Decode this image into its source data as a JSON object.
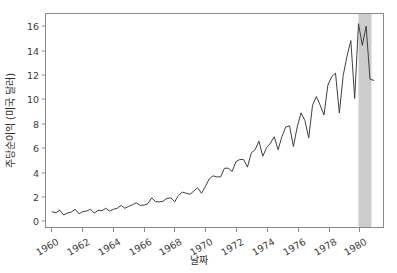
{
  "chart_data": {
    "type": "line",
    "title": "",
    "xlabel": "날짜",
    "ylabel": "주당순이익 (미국 달러)",
    "xlim": [
      1959.6,
      1981.6
    ],
    "ylim": [
      -0.55,
      17.1
    ],
    "grid": false,
    "legend": null,
    "line_color": "#404040",
    "line_width": 1.0,
    "span_color": "#cccccc",
    "axis_color": "#8a8a8a",
    "tick_label_color": "#3b3b3b",
    "xticks": [
      1960,
      1962,
      1964,
      1966,
      1968,
      1970,
      1972,
      1974,
      1976,
      1978,
      1980
    ],
    "xtick_labels": [
      "1960",
      "1962",
      "1964",
      "1966",
      "1968",
      "1970",
      "1972",
      "1974",
      "1976",
      "1978",
      "1980"
    ],
    "xtick_rotation": 30,
    "yticks": [
      0,
      2,
      4,
      6,
      8,
      10,
      12,
      14,
      16
    ],
    "ytick_labels": [
      "0",
      "2",
      "4",
      "6",
      "8",
      "10",
      "12",
      "14",
      "16"
    ],
    "shaded_spans": [
      {
        "name": "recession-band",
        "x0": 1980.0,
        "x1": 1980.85,
        "color": "#cccccc"
      }
    ],
    "series": [
      {
        "name": "주당순이익",
        "x": [
          1960.0,
          1960.25,
          1960.5,
          1960.75,
          1961.0,
          1961.25,
          1961.5,
          1961.75,
          1962.0,
          1962.25,
          1962.5,
          1962.75,
          1963.0,
          1963.25,
          1963.5,
          1963.75,
          1964.0,
          1964.25,
          1964.5,
          1964.75,
          1965.0,
          1965.25,
          1965.5,
          1965.75,
          1966.0,
          1966.25,
          1966.5,
          1966.75,
          1967.0,
          1967.25,
          1967.5,
          1967.75,
          1968.0,
          1968.25,
          1968.5,
          1968.75,
          1969.0,
          1969.25,
          1969.5,
          1969.75,
          1970.0,
          1970.25,
          1970.5,
          1970.75,
          1971.0,
          1971.25,
          1971.5,
          1971.75,
          1972.0,
          1972.25,
          1972.5,
          1972.75,
          1973.0,
          1973.25,
          1973.5,
          1973.75,
          1974.0,
          1974.25,
          1974.5,
          1974.75,
          1975.0,
          1975.25,
          1975.5,
          1975.75,
          1976.0,
          1976.25,
          1976.5,
          1976.75,
          1977.0,
          1977.25,
          1977.5,
          1977.75,
          1978.0,
          1978.25,
          1978.5,
          1978.75,
          1979.0,
          1979.25,
          1979.5,
          1979.75,
          1980.0,
          1980.25,
          1980.5,
          1980.75,
          1981.0
        ],
        "y": [
          0.71,
          0.63,
          0.85,
          0.44,
          0.61,
          0.69,
          0.92,
          0.55,
          0.72,
          0.77,
          0.92,
          0.6,
          0.83,
          0.8,
          1.0,
          0.77,
          0.92,
          1.0,
          1.24,
          1.0,
          1.16,
          1.3,
          1.45,
          1.25,
          1.26,
          1.38,
          1.86,
          1.56,
          1.53,
          1.59,
          1.83,
          1.86,
          1.53,
          2.07,
          2.34,
          2.25,
          2.16,
          2.43,
          2.7,
          2.25,
          2.79,
          3.42,
          3.69,
          3.6,
          3.6,
          4.32,
          4.32,
          4.05,
          4.86,
          5.04,
          5.04,
          4.41,
          5.58,
          5.85,
          6.57,
          5.31,
          6.03,
          6.39,
          6.93,
          5.85,
          6.93,
          7.74,
          7.83,
          6.12,
          7.74,
          8.91,
          8.28,
          6.84,
          9.54,
          10.26,
          9.54,
          8.73,
          11.2,
          11.9,
          12.2,
          8.9,
          12.0,
          13.6,
          14.9,
          10.1,
          16.3,
          14.5,
          16.1,
          11.7,
          11.6
        ]
      }
    ]
  },
  "axes": {
    "y_tick_values": [
      0,
      2,
      4,
      6,
      8,
      10,
      12,
      14,
      16
    ],
    "x_tick_values": [
      1960,
      1962,
      1964,
      1966,
      1968,
      1970,
      1972,
      1974,
      1976,
      1978,
      1980
    ]
  }
}
